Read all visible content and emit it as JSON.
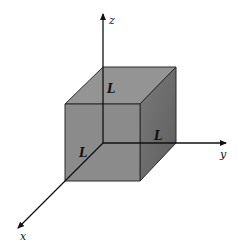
{
  "diagram": {
    "type": "3d-cube-on-axes",
    "axes": {
      "x": {
        "label": "x"
      },
      "y": {
        "label": "y"
      },
      "z": {
        "label": "z"
      }
    },
    "edge_labels": {
      "z_edge": "L",
      "x_edge": "L",
      "y_edge": "L"
    },
    "colors": {
      "top_face": "#949494",
      "front_face": "#8b8b8b",
      "right_face": "#6e6e6e",
      "edges": "#2a2a2a",
      "axes": "#111111"
    }
  }
}
